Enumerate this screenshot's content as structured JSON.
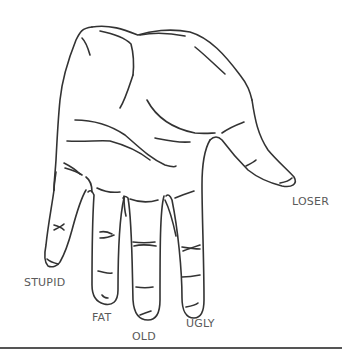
{
  "illustration": {
    "subject": "open hand line drawing",
    "stroke_color": "#333333",
    "label_color": "#5a5a5a",
    "labels": {
      "thumb": "LOSER",
      "index": "UGLY",
      "middle": "OLD",
      "ring": "FAT",
      "pinky": "STUPID"
    }
  }
}
